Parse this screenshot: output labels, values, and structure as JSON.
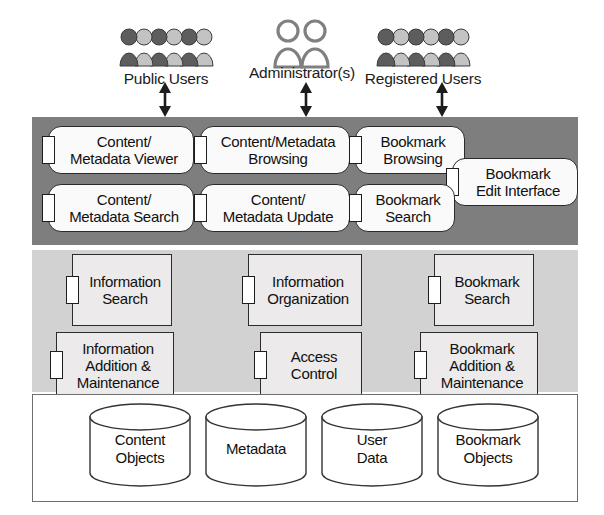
{
  "diagram": {
    "colors": {
      "interface_band": "#7e7e7e",
      "service_band": "#d2d2d2",
      "data_band": "#ffffff",
      "box_fill_interface": "#fafafa",
      "box_fill_service": "#eceaea",
      "outline": "#2b2b2b"
    }
  },
  "actors": [
    {
      "id": "public-users",
      "label": "Public Users",
      "icon": "crowd-of-users-icon",
      "x": 86,
      "y": 24,
      "arrow_x": 157,
      "arrow_y": 82,
      "arrow_height": 35
    },
    {
      "id": "administrators",
      "label": "Administrator(s)",
      "icon": "two-persons-icon",
      "x": 222,
      "y": 18,
      "arrow_x": 298,
      "arrow_y": 82,
      "arrow_height": 35
    },
    {
      "id": "registered-users",
      "label": "Registered Users",
      "icon": "crowd-of-users-icon",
      "x": 343,
      "y": 24,
      "arrow_x": 434,
      "arrow_y": 82,
      "arrow_height": 35
    }
  ],
  "layers": [
    {
      "id": "interface-layer",
      "name": "interface-layer",
      "style": "dark",
      "x": 32,
      "y": 117,
      "width": 546,
      "height": 128,
      "components": [
        {
          "id": "content-metadata-viewer",
          "label": "Content/\nMetadata Viewer",
          "shape": "rounded",
          "x": 48,
          "y": 126,
          "width": 146,
          "height": 48
        },
        {
          "id": "content-metadata-browsing",
          "label": "Content/Metadata\nBrowsing",
          "shape": "rounded",
          "x": 200,
          "y": 126,
          "width": 150,
          "height": 48
        },
        {
          "id": "bookmark-browsing",
          "label": "Bookmark\nBrowsing",
          "shape": "rounded",
          "x": 355,
          "y": 126,
          "width": 110,
          "height": 48
        },
        {
          "id": "bookmark-edit-interface",
          "label": "Bookmark\nEdit Interface",
          "shape": "rounded",
          "x": 452,
          "y": 158,
          "width": 126,
          "height": 48
        },
        {
          "id": "content-metadata-search",
          "label": "Content/\nMetadata Search",
          "shape": "rounded",
          "x": 48,
          "y": 184,
          "width": 146,
          "height": 48
        },
        {
          "id": "content-metadata-update",
          "label": "Content/\nMetadata Update",
          "shape": "rounded",
          "x": 200,
          "y": 184,
          "width": 150,
          "height": 48
        },
        {
          "id": "bookmark-search",
          "label": "Bookmark\nSearch",
          "shape": "rounded",
          "x": 355,
          "y": 184,
          "width": 100,
          "height": 48
        }
      ]
    },
    {
      "id": "service-layer",
      "name": "service-layer",
      "style": "light",
      "x": 32,
      "y": 250,
      "width": 546,
      "height": 142,
      "components": [
        {
          "id": "information-search",
          "label": "Information\nSearch",
          "shape": "square",
          "x": 72,
          "y": 254,
          "width": 100,
          "height": 72
        },
        {
          "id": "information-organization",
          "label": "Information\nOrganization",
          "shape": "square",
          "x": 248,
          "y": 254,
          "width": 114,
          "height": 72
        },
        {
          "id": "bookmark-search-service",
          "label": "Bookmark\nSearch",
          "shape": "square",
          "x": 434,
          "y": 254,
          "width": 100,
          "height": 72
        },
        {
          "id": "information-addition-maintenance",
          "label": "Information\nAddition &\nMaintenance",
          "shape": "square",
          "x": 56,
          "y": 332,
          "width": 118,
          "height": 66
        },
        {
          "id": "access-control",
          "label": "Access\nControl",
          "shape": "square",
          "x": 260,
          "y": 332,
          "width": 102,
          "height": 66
        },
        {
          "id": "bookmark-addition-maintenance",
          "label": "Bookmark\nAddition &\nMaintenance",
          "shape": "square",
          "x": 420,
          "y": 332,
          "width": 118,
          "height": 66
        }
      ]
    },
    {
      "id": "data-layer",
      "name": "data-layer",
      "style": "white",
      "x": 32,
      "y": 394,
      "width": 546,
      "height": 108,
      "stores": [
        {
          "id": "content-objects-store",
          "label": "Content\nObjects",
          "x": 88,
          "y": 403
        },
        {
          "id": "metadata-store",
          "label": "Metadata",
          "x": 204,
          "y": 403
        },
        {
          "id": "user-data-store",
          "label": "User\nData",
          "x": 320,
          "y": 403
        },
        {
          "id": "bookmark-objects-store",
          "label": "Bookmark\nObjects",
          "x": 436,
          "y": 403
        }
      ]
    }
  ]
}
